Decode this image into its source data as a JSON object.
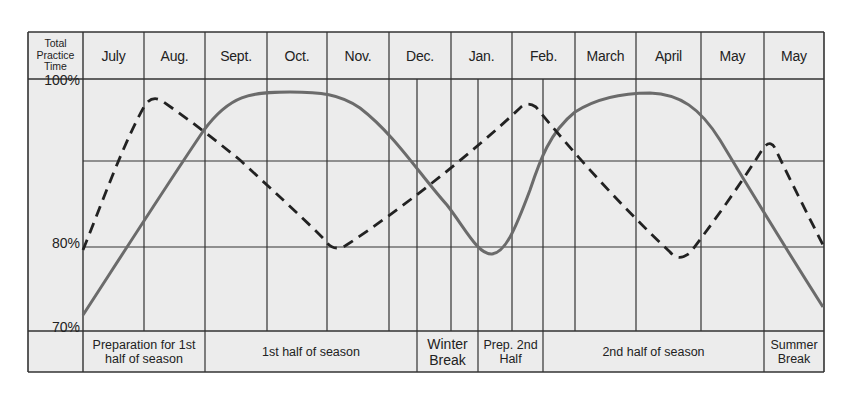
{
  "header": {
    "corner_label": "Total Practice Time",
    "months": [
      {
        "label": "July",
        "x0": 83,
        "x1": 144
      },
      {
        "label": "Aug.",
        "x0": 144,
        "x1": 205
      },
      {
        "label": "Sept.",
        "x0": 205,
        "x1": 267
      },
      {
        "label": "Oct.",
        "x0": 267,
        "x1": 327
      },
      {
        "label": "Nov.",
        "x0": 327,
        "x1": 389
      },
      {
        "label": "Dec.",
        "x0": 389,
        "x1": 451
      },
      {
        "label": "Jan.",
        "x0": 451,
        "x1": 512
      },
      {
        "label": "Feb.",
        "x0": 512,
        "x1": 575
      },
      {
        "label": "March",
        "x0": 575,
        "x1": 636
      },
      {
        "label": "April",
        "x0": 636,
        "x1": 701
      },
      {
        "label": "May",
        "x0": 701,
        "x1": 764
      },
      {
        "label": "May",
        "x0": 764,
        "x1": 824
      }
    ]
  },
  "y_axis": {
    "labels": [
      {
        "label": "100%",
        "y": 84
      },
      {
        "label": "80%",
        "y": 247
      },
      {
        "label": "70%",
        "y": 331
      }
    ]
  },
  "phases": [
    {
      "label": "Preparation for 1st half of season",
      "x0": 83,
      "x1": 205,
      "big": false
    },
    {
      "label": "1st half of season",
      "x0": 205,
      "x1": 417,
      "big": false
    },
    {
      "label": "Winter Break",
      "x0": 417,
      "x1": 478,
      "big": true
    },
    {
      "label": "Prep. 2nd Half",
      "x0": 478,
      "x1": 543,
      "big": false
    },
    {
      "label": "2nd half of season",
      "x0": 543,
      "x1": 764,
      "big": false
    },
    {
      "label": "Summer Break",
      "x0": 764,
      "x1": 824,
      "big": false
    }
  ],
  "colors": {
    "background": "#ececec",
    "grid": "#333333",
    "solid_line": "#6b6b6b",
    "dashed_line": "#222222"
  },
  "chart_data": {
    "type": "line",
    "title": "",
    "xlabel": "",
    "ylabel": "Total Practice Time",
    "categories": [
      "July",
      "Aug.",
      "Sept.",
      "Oct.",
      "Nov.",
      "Dec.",
      "Jan.",
      "Feb.",
      "March",
      "April",
      "May",
      "May"
    ],
    "y_ticks": [
      "100%",
      "80%",
      "70%"
    ],
    "ylim": [
      70,
      100
    ],
    "grid": true,
    "legend": null,
    "phases": [
      "Preparation for 1st half of season",
      "1st half of season",
      "Winter Break",
      "Prep. 2nd Half",
      "2nd half of season",
      "Summer Break"
    ],
    "series": [
      {
        "name": "solid curve",
        "style": "solid",
        "points": [
          {
            "x": "July (start)",
            "y": 71.8
          },
          {
            "x": "Aug. (end)",
            "y": 90.5
          },
          {
            "x": "Oct.",
            "y": 98.7
          },
          {
            "x": "Nov. (start)",
            "y": 98.5
          },
          {
            "x": "Dec. (end)",
            "y": 87.0
          },
          {
            "x": "Jan. (mid)",
            "y": 79.2
          },
          {
            "x": "Feb. (mid)",
            "y": 90.0
          },
          {
            "x": "April (start)",
            "y": 98.6
          },
          {
            "x": "May (start)",
            "y": 96.5
          },
          {
            "x": "May (end)",
            "y": 72.8
          }
        ]
      },
      {
        "name": "dashed curve",
        "style": "dashed",
        "points": [
          {
            "x": "July (start)",
            "y": 80.0
          },
          {
            "x": "Aug. (early)",
            "y": 97.7
          },
          {
            "x": "Sept. (start)",
            "y": 94.0
          },
          {
            "x": "Nov. (start)",
            "y": 79.8
          },
          {
            "x": "Feb. (mid)",
            "y": 97.1
          },
          {
            "x": "April (mid)",
            "y": 78.7
          },
          {
            "x": "May (2nd, start)",
            "y": 92.5
          },
          {
            "x": "May (2nd, end)",
            "y": 80.2
          }
        ]
      }
    ]
  }
}
